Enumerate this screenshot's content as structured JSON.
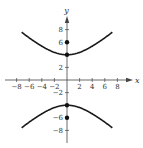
{
  "chart_data": {
    "type": "line",
    "title": "",
    "xlabel": "x",
    "ylabel": "y",
    "xlim": [
      -9,
      9
    ],
    "ylim": [
      -10,
      10
    ],
    "grid": false,
    "x_ticks": [
      -8,
      -6,
      -4,
      -2,
      2,
      4,
      6,
      8
    ],
    "x_tick_labels": [
      "−8",
      "−6",
      "−4",
      "−2",
      "2",
      "4",
      "6",
      "8"
    ],
    "y_ticks": [
      8,
      6,
      2,
      -2,
      -6,
      -8
    ],
    "y_tick_labels": [
      "8",
      "6",
      "2",
      "−2",
      "−6",
      "−8"
    ],
    "series": [
      {
        "name": "hyperbola upper branch",
        "equation": "y^2/16 - x^2/20 = 1",
        "x": [
          -7,
          -6,
          -4,
          -2,
          0,
          2,
          4,
          6,
          7
        ],
        "y": [
          8.06,
          7.48,
          6.07,
          4.9,
          4,
          4.9,
          6.07,
          7.48,
          8.06
        ]
      },
      {
        "name": "hyperbola lower branch",
        "x": [
          -7,
          -6,
          -4,
          -2,
          0,
          2,
          4,
          6,
          7
        ],
        "y": [
          -8.06,
          -7.48,
          -6.07,
          -4.9,
          -4,
          -4.9,
          -6.07,
          -7.48,
          -8.06
        ]
      }
    ],
    "points": [
      {
        "label": "vertex",
        "x": 0,
        "y": 4
      },
      {
        "label": "focus",
        "x": 0,
        "y": 6
      },
      {
        "label": "vertex",
        "x": 0,
        "y": -4
      },
      {
        "label": "focus",
        "x": 0,
        "y": -6
      }
    ],
    "colors": {
      "curve": "#1a1a1a",
      "axis": "#444444",
      "point": "#111111"
    }
  }
}
